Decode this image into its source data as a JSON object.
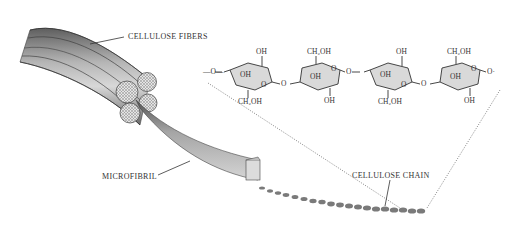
{
  "diagram": {
    "labels": {
      "cellulose_fibers": "CELLULOSE FIBERS",
      "microfibril": "MICROFIBRIL",
      "cellulose_chain": "CELLULOSE CHAIN"
    },
    "glucose_units": [
      {
        "top": "OH",
        "center": "OH",
        "bottom": "CH₂OH",
        "ring_o": "O"
      },
      {
        "top": "CH₂OH",
        "center": "OH",
        "bottom": "OH",
        "ring_o": "O"
      },
      {
        "top": "OH",
        "center": "OH",
        "bottom": "CH₂OH",
        "ring_o": "O"
      },
      {
        "top": "CH₂OH",
        "center": "OH",
        "bottom": "OH",
        "ring_o": "O"
      }
    ],
    "linkages": {
      "left_end": "—O—",
      "link_1": "O",
      "link_2": "O",
      "link_3": "O",
      "right_end": "O·"
    },
    "colors": {
      "fiber_dark": "#6e6e6e",
      "fiber_mid": "#a8a8a8",
      "fiber_light": "#d6d6d6",
      "ring_fill": "#d9d9d9",
      "bead": "#7a7a7a",
      "text": "#333333"
    }
  }
}
